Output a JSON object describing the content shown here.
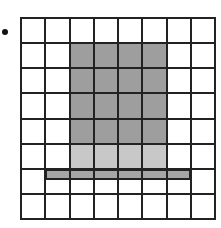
{
  "diagram": {
    "type": "grid",
    "rows": 8,
    "cols": 8,
    "colors": {
      "background": "#ffffff",
      "line": "#222222",
      "dark_fill": "#9e9e9e",
      "light_fill": "#c8c8c8",
      "strip_fill": "#a6a6a6",
      "bullet": "#111111"
    },
    "dark_region": {
      "col_start": 2,
      "col_end": 5,
      "row_start": 1,
      "row_end": 4
    },
    "light_region": {
      "col_start": 2,
      "col_end": 5,
      "row_start": 5,
      "row_end": 5
    },
    "strip_region": {
      "col_start": 1,
      "col_end": 6,
      "row": 6,
      "height_fraction": 0.45
    }
  }
}
